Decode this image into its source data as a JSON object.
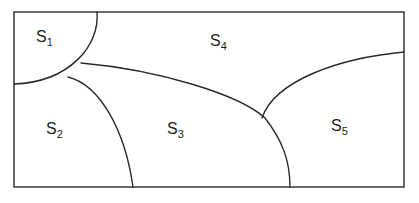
{
  "diagram": {
    "type": "region-partition",
    "colors": {
      "line": "#2a2a2a",
      "text": "#1e1e1e",
      "background": "#ffffff"
    },
    "regions": [
      {
        "id": "S1",
        "base": "S",
        "sub": "1"
      },
      {
        "id": "S2",
        "base": "S",
        "sub": "2"
      },
      {
        "id": "S3",
        "base": "S",
        "sub": "3"
      },
      {
        "id": "S4",
        "base": "S",
        "sub": "4"
      },
      {
        "id": "S5",
        "base": "S",
        "sub": "5"
      }
    ]
  }
}
